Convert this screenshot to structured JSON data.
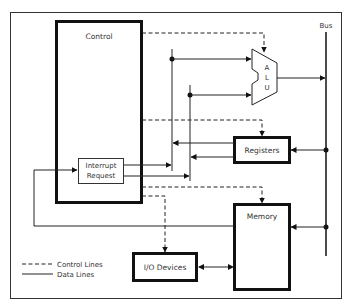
{
  "diagram": {
    "title": "",
    "components": {
      "control": "Control",
      "interrupt_line1": "Interrupt",
      "interrupt_line2": "Request",
      "alu_letters": [
        "A",
        "L",
        "U"
      ],
      "registers": "Registers",
      "memory": "Memory",
      "io_devices": "I/O Devices",
      "bus": "Bus"
    },
    "legend": {
      "control_lines": "Control Lines",
      "data_lines": "Data Lines"
    },
    "colors": {
      "line": "#111111",
      "background": "#ffffff"
    }
  }
}
